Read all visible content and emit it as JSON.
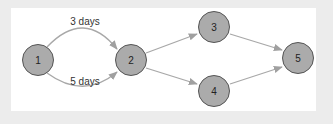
{
  "diagram": {
    "type": "network-graph",
    "colors": {
      "background": "#ececec",
      "panel": "#ffffff",
      "node_fill": "#ababab",
      "node_stroke": "#555555",
      "edge": "#a8a8a8"
    },
    "nodes": [
      {
        "id": "1",
        "label": "1",
        "x": 38,
        "y": 60
      },
      {
        "id": "2",
        "label": "2",
        "x": 131,
        "y": 60
      },
      {
        "id": "3",
        "label": "3",
        "x": 214,
        "y": 27
      },
      {
        "id": "4",
        "label": "4",
        "x": 214,
        "y": 91
      },
      {
        "id": "5",
        "label": "5",
        "x": 298,
        "y": 58
      }
    ],
    "edges": [
      {
        "from": "1",
        "to": "2",
        "label": "3 days",
        "curve": "upper"
      },
      {
        "from": "1",
        "to": "2",
        "label": "5 days",
        "curve": "lower"
      },
      {
        "from": "2",
        "to": "3",
        "label": ""
      },
      {
        "from": "2",
        "to": "4",
        "label": ""
      },
      {
        "from": "3",
        "to": "5",
        "label": ""
      },
      {
        "from": "4",
        "to": "5",
        "label": ""
      }
    ]
  }
}
